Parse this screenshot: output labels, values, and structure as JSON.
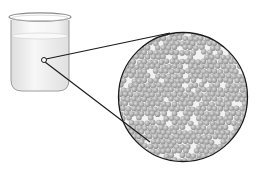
{
  "figure": {
    "colors": {
      "background": "#ffffff",
      "outline": "#1a1a1a",
      "beaker_glass": "#f4f4f4",
      "beaker_edge": "#9a9a9a",
      "liquid": "#ececec",
      "particle": "#a8a8a8",
      "particle_highlight": "#d8d8d8",
      "circle_bg": "#f2f2f2"
    },
    "beaker": {
      "x": 9,
      "y": 13,
      "width": 62,
      "height": 78
    },
    "magnifier_point": {
      "cx": 44,
      "cy": 60,
      "r": 2.5
    },
    "magnified_circle": {
      "cx": 183,
      "cy": 97,
      "r": 65
    },
    "connector_lines": [
      {
        "from": [
          46,
          59
        ],
        "to": [
          170,
          33
        ]
      },
      {
        "from": [
          45,
          62
        ],
        "to": [
          150,
          142
        ]
      }
    ],
    "particle_radius": 2.8,
    "particle_spacing": 5.4
  }
}
